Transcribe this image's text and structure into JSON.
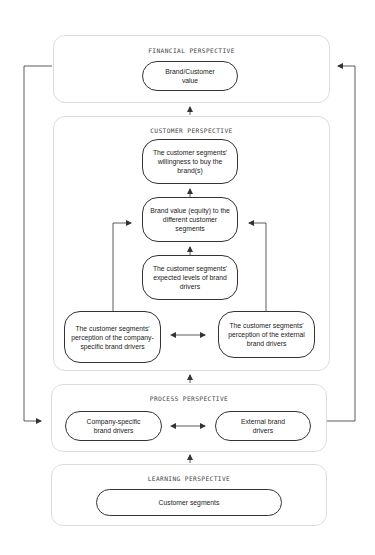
{
  "diagram": {
    "panels": {
      "financial": {
        "title": "FINANCIAL PERSPECTIVE"
      },
      "customer": {
        "title": "CUSTOMER PERSPECTIVE"
      },
      "process": {
        "title": "PROCESS PERSPECTIVE"
      },
      "learning": {
        "title": "LEARNING PERSPECTIVE"
      }
    },
    "nodes": {
      "brand_customer_value": "Brand/Customer value",
      "willingness_to_buy": "The customer segments' willingness to buy the brand(s)",
      "brand_value_equity": "Brand value (equity) to the different customer segments",
      "expected_levels": "The customer segments' expected levels of brand drivers",
      "perception_company": "The customer segments' perception of the company- specific brand drivers",
      "perception_external": "The customer segments' perception of the external brand drivers",
      "company_drivers": "Company-specific brand drivers",
      "external_drivers": "External brand drivers",
      "customer_segments": "Customer segments"
    },
    "colors": {
      "panel_border": "#dcdcdc",
      "node_border": "#333333",
      "line": "#333333"
    }
  }
}
